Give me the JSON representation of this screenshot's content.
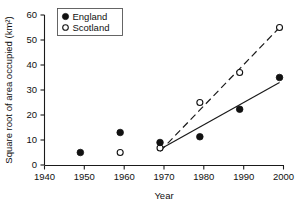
{
  "chart_data": {
    "type": "scatter",
    "title": "",
    "xlabel": "Year",
    "ylabel": "Square root of area occupied (km²)",
    "xlim": [
      1940,
      2000
    ],
    "ylim": [
      0,
      60
    ],
    "xticks": [
      1940,
      1950,
      1960,
      1970,
      1980,
      1990,
      2000
    ],
    "yticks": [
      0,
      10,
      20,
      30,
      40,
      50,
      60
    ],
    "grid": false,
    "legend_position": "top-left",
    "series": [
      {
        "name": "England",
        "marker": "filled-circle",
        "x": [
          1949,
          1959,
          1969,
          1979,
          1989,
          1999
        ],
        "values": [
          5,
          13,
          9,
          11.3,
          22.3,
          35
        ],
        "trendline": {
          "style": "solid",
          "x": [
            1969,
            1999
          ],
          "y": [
            6.3,
            33
          ]
        }
      },
      {
        "name": "Scotland",
        "marker": "open-circle",
        "x": [
          1959,
          1969,
          1979,
          1989,
          1999
        ],
        "values": [
          5,
          6.8,
          25,
          37,
          55
        ],
        "trendline": {
          "style": "dashed",
          "x": [
            1969,
            1999
          ],
          "y": [
            5.5,
            55
          ]
        }
      }
    ]
  },
  "legend": {
    "entries": [
      {
        "label": "England",
        "marker": "filled-circle"
      },
      {
        "label": "Scotland",
        "marker": "open-circle"
      }
    ]
  },
  "axes": {
    "x_tick_labels": [
      "1940",
      "1950",
      "1960",
      "1970",
      "1980",
      "1990",
      "2000"
    ],
    "y_tick_labels": [
      "0",
      "10",
      "20",
      "30",
      "40",
      "50",
      "60"
    ],
    "x_axis_title": "Year",
    "y_axis_title": "Square root of area occupied (km²)"
  },
  "colors": {
    "axis": "#1a1a1a",
    "marker_fill": "#111111",
    "marker_open_fill": "#ffffff",
    "background": "#ffffff"
  }
}
